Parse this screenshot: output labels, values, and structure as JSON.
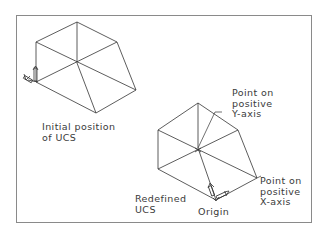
{
  "diagram": {
    "frame": {
      "left": 16,
      "top": 15,
      "right": 312,
      "bottom": 223
    },
    "line_color": "#333333",
    "frame_color": "#8a8a8a",
    "labels": {
      "initial_line1": "Initial position",
      "initial_line2": "of UCS",
      "point_y_line1": "Point on",
      "point_y_line2": "positive",
      "point_y_line3": "Y-axis",
      "point_x_line1": "Point on",
      "point_x_line2": "positive",
      "point_x_line3": "X-axis",
      "redefined_line1": "Redefined",
      "redefined_line2": "UCS",
      "origin": "Origin"
    }
  }
}
